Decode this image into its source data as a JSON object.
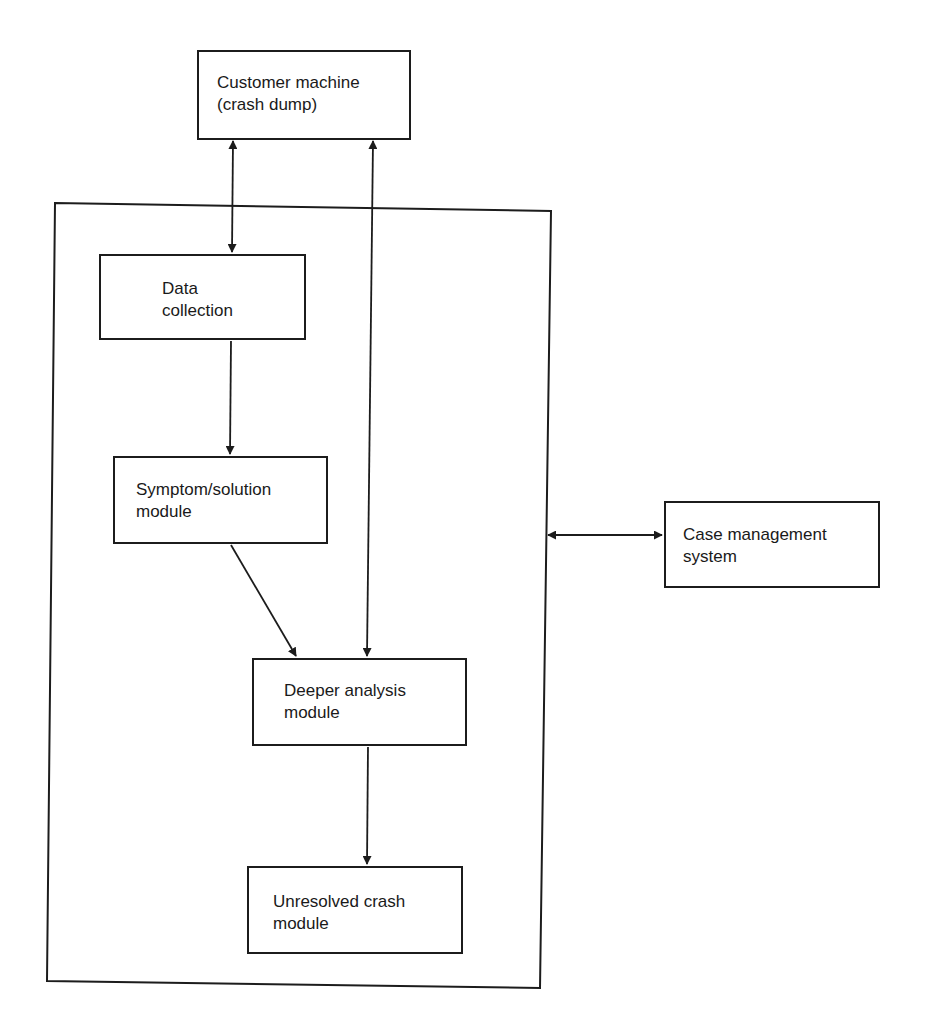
{
  "diagram": {
    "type": "block-diagram",
    "container": {
      "label": ""
    },
    "nodes": [
      {
        "id": "customer",
        "label": "Customer machine\n(crash dump)"
      },
      {
        "id": "data_collection",
        "label": "Data\ncollection"
      },
      {
        "id": "symptom_solution",
        "label": "Symptom/solution\nmodule"
      },
      {
        "id": "deeper_analysis",
        "label": "Deeper analysis\nmodule"
      },
      {
        "id": "unresolved_crash",
        "label": "Unresolved crash\nmodule"
      },
      {
        "id": "case_management",
        "label": "Case management\nsystem"
      }
    ],
    "edges": [
      {
        "from": "customer",
        "to": "data_collection",
        "direction": "bidirectional"
      },
      {
        "from": "customer",
        "to": "deeper_analysis",
        "direction": "bidirectional"
      },
      {
        "from": "data_collection",
        "to": "symptom_solution",
        "direction": "forward"
      },
      {
        "from": "symptom_solution",
        "to": "deeper_analysis",
        "direction": "forward"
      },
      {
        "from": "deeper_analysis",
        "to": "unresolved_crash",
        "direction": "forward"
      },
      {
        "from": "container",
        "to": "case_management",
        "direction": "bidirectional"
      }
    ],
    "colors": {
      "stroke": "#1c1c1c",
      "background": "#ffffff"
    }
  }
}
